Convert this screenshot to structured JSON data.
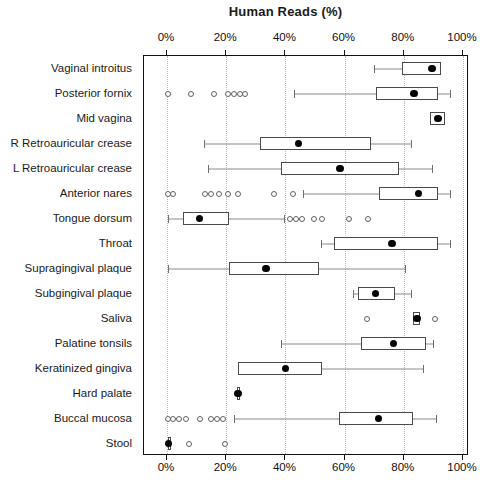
{
  "chart_data": {
    "type": "box",
    "title": "Human Reads (%)",
    "xlabel": "",
    "ylabel": "",
    "xlim": [
      0,
      100
    ],
    "grid": true,
    "legend": "none",
    "axis_ticks": [
      "0%",
      "20%",
      "40%",
      "60%",
      "80%",
      "100%"
    ],
    "axis_tick_values": [
      0,
      20,
      40,
      60,
      80,
      100
    ],
    "axis_positions": "top-and-bottom",
    "categories": [
      "Vaginal introitus",
      "Posterior fornix",
      "Mid vagina",
      "R Retroauricular crease",
      "L Retroauricular crease",
      "Anterior nares",
      "Tongue dorsum",
      "Throat",
      "Supragingival plaque",
      "Subgingival plaque",
      "Saliva",
      "Palatine tonsils",
      "Keratinized gingiva",
      "Hard palate",
      "Buccal mucosa",
      "Stool"
    ],
    "boxes": [
      {
        "category": "Vaginal introitus",
        "whisker_low": 70.0,
        "q1": 79.5,
        "q3": 92.5,
        "mean": 89.5,
        "whisker_high": 92.5,
        "outliers": []
      },
      {
        "category": "Posterior fornix",
        "whisker_low": 43.0,
        "q1": 70.5,
        "q3": 91.5,
        "mean": 83.5,
        "whisker_high": 95.5,
        "outliers": [
          0.5,
          8.0,
          16.0,
          20.5,
          22.5,
          24.5,
          26.5
        ]
      },
      {
        "category": "Mid vagina",
        "whisker_low": 89.0,
        "q1": 89.0,
        "q3": 94.0,
        "mean": 91.5,
        "whisker_high": 94.0,
        "outliers": []
      },
      {
        "category": "R Retroauricular crease",
        "whisker_low": 12.5,
        "q1": 31.5,
        "q3": 69.0,
        "mean": 44.5,
        "whisker_high": 82.5,
        "outliers": []
      },
      {
        "category": "L Retroauricular crease",
        "whisker_low": 14.0,
        "q1": 38.5,
        "q3": 78.5,
        "mean": 58.5,
        "whisker_high": 89.5,
        "outliers": []
      },
      {
        "category": "Anterior nares",
        "whisker_low": 46.0,
        "q1": 71.5,
        "q3": 91.5,
        "mean": 85.0,
        "whisker_high": 95.5,
        "outliers": [
          0.3,
          2.0,
          13.0,
          15.0,
          17.5,
          20.5,
          24.0,
          36.0,
          42.5
        ]
      },
      {
        "category": "Tongue dorsum",
        "whisker_low": 0.5,
        "q1": 5.5,
        "q3": 21.0,
        "mean": 11.0,
        "whisker_high": 39.5,
        "outliers": [
          41.5,
          43.5,
          45.5,
          49.5,
          52.5,
          61.5,
          68.0
        ]
      },
      {
        "category": "Throat",
        "whisker_low": 52.0,
        "q1": 56.5,
        "q3": 91.5,
        "mean": 76.0,
        "whisker_high": 95.5,
        "outliers": []
      },
      {
        "category": "Supragingival plaque",
        "whisker_low": 0.5,
        "q1": 21.0,
        "q3": 51.5,
        "mean": 33.5,
        "whisker_high": 80.5,
        "outliers": []
      },
      {
        "category": "Subgingival plaque",
        "whisker_low": 63.0,
        "q1": 64.5,
        "q3": 77.0,
        "mean": 70.5,
        "whisker_high": 82.5,
        "outliers": []
      },
      {
        "category": "Saliva",
        "whisker_low": 83.0,
        "q1": 83.0,
        "q3": 85.5,
        "mean": 84.5,
        "whisker_high": 85.5,
        "outliers": [
          67.5,
          90.5
        ]
      },
      {
        "category": "Palatine tonsils",
        "whisker_low": 38.5,
        "q1": 65.5,
        "q3": 87.5,
        "mean": 76.5,
        "whisker_high": 90.0,
        "outliers": []
      },
      {
        "category": "Keratinized gingiva",
        "whisker_low": 24.0,
        "q1": 24.0,
        "q3": 52.5,
        "mean": 40.0,
        "whisker_high": 86.5,
        "outliers": []
      },
      {
        "category": "Hard palate",
        "whisker_low": 23.5,
        "q1": 23.5,
        "q3": 24.5,
        "mean": 24.0,
        "whisker_high": 24.5,
        "outliers": []
      },
      {
        "category": "Buccal mucosa",
        "whisker_low": 22.5,
        "q1": 58.0,
        "q3": 83.0,
        "mean": 71.5,
        "whisker_high": 91.0,
        "outliers": [
          0.3,
          2.0,
          4.0,
          6.5,
          11.0,
          15.0,
          17.0,
          19.0
        ]
      },
      {
        "category": "Stool",
        "whisker_low": 0.2,
        "q1": 0.2,
        "q3": 1.5,
        "mean": 0.5,
        "whisker_high": 1.5,
        "outliers": [
          7.5,
          19.5
        ]
      }
    ]
  }
}
